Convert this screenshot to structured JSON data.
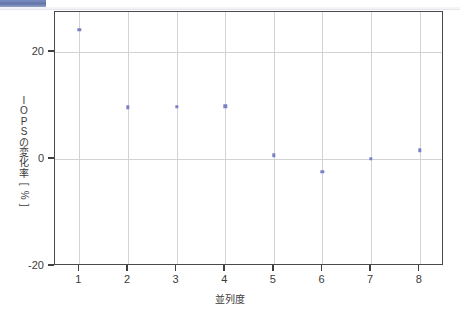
{
  "window": {
    "chrome_fragment_color": "#56699f"
  },
  "chart_data": {
    "type": "scatter",
    "title": "",
    "xlabel": "並列度",
    "ylabel": "IOPSの変化率[%]",
    "ylabel_chars": [
      "I",
      "O",
      "P",
      "S",
      "の",
      "変",
      "化",
      "率",
      "[",
      "%",
      "]"
    ],
    "x": [
      1,
      2,
      3,
      4,
      5,
      6,
      7,
      8
    ],
    "values": [
      24.2,
      9.7,
      9.8,
      9.9,
      0.7,
      -2.4,
      0.0,
      1.6
    ],
    "xtick_labels": [
      "1",
      "2",
      "3",
      "4",
      "5",
      "6",
      "7",
      "8"
    ],
    "ytick_labels": [
      "20",
      "0",
      "-20"
    ],
    "yticks": [
      20,
      0,
      -20
    ],
    "xlim": [
      0.5,
      8.5
    ],
    "ylim": [
      -20,
      27.5
    ],
    "grid": true,
    "grid_color": "#d3d3d6",
    "marker_color": "#7b7fc4",
    "axis_color": "#4a4a4a",
    "legend": null,
    "legend_position": "none"
  }
}
